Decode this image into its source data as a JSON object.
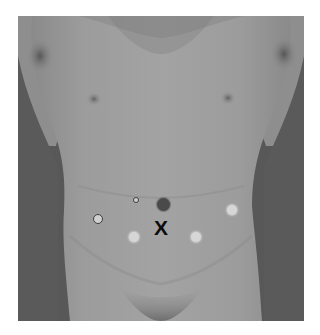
{
  "figure": {
    "colors": {
      "background": "#ffffff",
      "skin": "#9a9a9a",
      "shadow": "#555555",
      "marker_light": "#d6d6d6",
      "marker_outline_fill": "#cfcfcf",
      "marker_outline_border": "#3e3e3e",
      "marker_dark": "#4a4a4a",
      "x_mark": "#0d0d0d"
    },
    "markers": [
      {
        "id": "small-outlined-port",
        "type": "outline",
        "cx": 136,
        "cy": 200,
        "r": 3
      },
      {
        "id": "dark-port",
        "type": "dark",
        "cx": 163,
        "cy": 204,
        "r": 6.5
      },
      {
        "id": "left-lateral-outlined-port",
        "type": "outline",
        "cx": 98,
        "cy": 219,
        "r": 5
      },
      {
        "id": "right-lateral-light-port",
        "type": "light",
        "cx": 232,
        "cy": 210,
        "r": 5
      },
      {
        "id": "left-lower-light-port",
        "type": "light",
        "cx": 134,
        "cy": 237,
        "r": 5
      },
      {
        "id": "right-lower-light-port",
        "type": "light",
        "cx": 196,
        "cy": 237,
        "r": 5
      }
    ],
    "x_mark": {
      "label": "X",
      "cx": 161,
      "cy": 228,
      "size": 20
    }
  }
}
